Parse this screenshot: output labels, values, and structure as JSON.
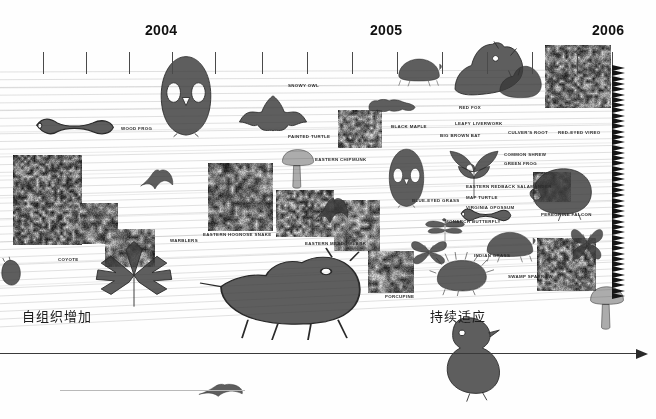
{
  "figure": {
    "type": "timeline-infographic",
    "background_color": "#fefefe",
    "line_color": "#dcdcdc",
    "axis_color": "#3a3a3a",
    "text_color": "#2a2a2a"
  },
  "timeline": {
    "years": [
      {
        "label": "2004",
        "x": 165
      },
      {
        "label": "2005",
        "x": 390
      },
      {
        "label": "2006",
        "x": 612
      }
    ],
    "tick_y": 52,
    "tick_height": 22,
    "tick_positions": [
      43,
      86,
      129,
      172,
      215,
      262,
      307,
      352,
      397,
      442,
      487,
      532,
      577,
      612
    ]
  },
  "annotations": [
    {
      "id": "left-note",
      "text": "自组织增加",
      "x": 22,
      "y": 306
    },
    {
      "id": "right-note",
      "text": "持续适应",
      "x": 430,
      "y": 306
    }
  ],
  "species_labels": [
    {
      "text": "WOOD FROG",
      "x": 121,
      "y": 126
    },
    {
      "text": "SNOWY OWL",
      "x": 288,
      "y": 83
    },
    {
      "text": "PAINTED TURTLE",
      "x": 288,
      "y": 134
    },
    {
      "text": "EASTERN CHIPMUNK",
      "x": 315,
      "y": 157
    },
    {
      "text": "BLACK MAPLE",
      "x": 391,
      "y": 124
    },
    {
      "text": "BIG BROWN BAT",
      "x": 440,
      "y": 133
    },
    {
      "text": "RED FOX",
      "x": 459,
      "y": 105
    },
    {
      "text": "LEAFY LIVERWORK",
      "x": 455,
      "y": 121
    },
    {
      "text": "CULVER'S ROOT",
      "x": 508,
      "y": 130
    },
    {
      "text": "RED-EYED VIREO",
      "x": 558,
      "y": 130
    },
    {
      "text": "COMMON SHREW",
      "x": 504,
      "y": 152
    },
    {
      "text": "GREEN FROG",
      "x": 504,
      "y": 161
    },
    {
      "text": "EASTERN REDBACK SALAMANDER",
      "x": 466,
      "y": 184
    },
    {
      "text": "MAP TURTLE",
      "x": 466,
      "y": 195
    },
    {
      "text": "BLUE-EYED GRASS",
      "x": 412,
      "y": 198
    },
    {
      "text": "VIRGINIA OPOSSUM",
      "x": 466,
      "y": 205
    },
    {
      "text": "PEREGRINE FALCON",
      "x": 541,
      "y": 212
    },
    {
      "text": "MONARCH BUTTERFLY",
      "x": 445,
      "y": 219
    },
    {
      "text": "INDIAN GRASS",
      "x": 474,
      "y": 253
    },
    {
      "text": "SWAMP SPARROW",
      "x": 508,
      "y": 274
    },
    {
      "text": "EASTERN HOGNOSE SNAKE",
      "x": 203,
      "y": 232
    },
    {
      "text": "EASTERN MEADOWLARK",
      "x": 305,
      "y": 241
    },
    {
      "text": "WARBLERS",
      "x": 170,
      "y": 238
    },
    {
      "text": "COYOTE",
      "x": 58,
      "y": 257
    },
    {
      "text": "PORCUPINE",
      "x": 385,
      "y": 294
    }
  ],
  "photo_tiles": [
    {
      "name": "sunflower-field-tile",
      "x": 13,
      "y": 155,
      "w": 69,
      "h": 90,
      "seed": 11,
      "scale": 3.2,
      "dark": 0.62
    },
    {
      "name": "wild-plants-tile",
      "x": 80,
      "y": 203,
      "w": 38,
      "h": 41,
      "seed": 23,
      "scale": 4.0,
      "dark": 0.48
    },
    {
      "name": "hognose-snake-tile",
      "x": 208,
      "y": 163,
      "w": 65,
      "h": 68,
      "seed": 31,
      "scale": 3.6,
      "dark": 0.5
    },
    {
      "name": "meadowlark-field-tile",
      "x": 276,
      "y": 190,
      "w": 58,
      "h": 47,
      "seed": 43,
      "scale": 3.0,
      "dark": 0.42
    },
    {
      "name": "black-maple-tile",
      "x": 338,
      "y": 110,
      "w": 44,
      "h": 38,
      "seed": 57,
      "scale": 3.4,
      "dark": 0.38
    },
    {
      "name": "red-eyed-vireo-tile",
      "x": 545,
      "y": 45,
      "w": 66,
      "h": 63,
      "seed": 67,
      "scale": 3.1,
      "dark": 0.46
    },
    {
      "name": "peregrine-nest-tile",
      "x": 533,
      "y": 172,
      "w": 38,
      "h": 30,
      "seed": 71,
      "scale": 4.4,
      "dark": 0.44
    },
    {
      "name": "swamp-sparrow-tile",
      "x": 537,
      "y": 238,
      "w": 59,
      "h": 53,
      "seed": 83,
      "scale": 3.3,
      "dark": 0.52
    },
    {
      "name": "blue-eyed-grass-tile",
      "x": 334,
      "y": 200,
      "w": 46,
      "h": 51,
      "seed": 97,
      "scale": 3.8,
      "dark": 0.34
    },
    {
      "name": "indian-grass-tile",
      "x": 105,
      "y": 229,
      "w": 50,
      "h": 38,
      "seed": 29,
      "scale": 3.5,
      "dark": 0.47
    },
    {
      "name": "porcupine-habitat-tile",
      "x": 368,
      "y": 251,
      "w": 46,
      "h": 42,
      "seed": 53,
      "scale": 3.7,
      "dark": 0.4
    }
  ],
  "specimens": [
    {
      "name": "wood-frog",
      "shape": "salamander",
      "x": 35,
      "y": 108,
      "w": 80,
      "h": 30
    },
    {
      "name": "snowy-owl",
      "shape": "owl",
      "x": 155,
      "y": 55,
      "w": 62,
      "h": 85
    },
    {
      "name": "big-brown-bat",
      "shape": "bat",
      "x": 238,
      "y": 93,
      "w": 70,
      "h": 42
    },
    {
      "name": "warbler-bird",
      "shape": "flyingbird",
      "x": 140,
      "y": 168,
      "w": 34,
      "h": 22
    },
    {
      "name": "eastern-chipmunk",
      "shape": "mushroom",
      "x": 280,
      "y": 148,
      "w": 36,
      "h": 40
    },
    {
      "name": "painted-turtle",
      "shape": "turtle",
      "x": 396,
      "y": 55,
      "w": 48,
      "h": 32
    },
    {
      "name": "red-fox",
      "shape": "fox",
      "x": 452,
      "y": 40,
      "w": 75,
      "h": 58
    },
    {
      "name": "culvers-root",
      "shape": "fox2",
      "x": 497,
      "y": 62,
      "w": 48,
      "h": 38
    },
    {
      "name": "leafy-liverwork",
      "shape": "caterpillar",
      "x": 368,
      "y": 99,
      "w": 48,
      "h": 14
    },
    {
      "name": "barred-owl",
      "shape": "owl",
      "x": 385,
      "y": 148,
      "w": 43,
      "h": 62
    },
    {
      "name": "common-shrew-plant",
      "shape": "plant",
      "x": 444,
      "y": 148,
      "w": 60,
      "h": 52
    },
    {
      "name": "virginia-opossum",
      "shape": "opossum",
      "x": 528,
      "y": 163,
      "w": 66,
      "h": 58
    },
    {
      "name": "blue-eyed-grass-bird",
      "shape": "flyingbird",
      "x": 315,
      "y": 196,
      "w": 34,
      "h": 28
    },
    {
      "name": "map-turtle-salamander",
      "shape": "salamander",
      "x": 460,
      "y": 200,
      "w": 52,
      "h": 24
    },
    {
      "name": "monarch-butterfly",
      "shape": "dragonfly",
      "x": 424,
      "y": 218,
      "w": 42,
      "h": 30
    },
    {
      "name": "butterfly-black",
      "shape": "butterfly",
      "x": 410,
      "y": 236,
      "w": 38,
      "h": 30
    },
    {
      "name": "swamp-turtle",
      "shape": "turtle",
      "x": 484,
      "y": 228,
      "w": 54,
      "h": 35
    },
    {
      "name": "swallowtail",
      "shape": "butterfly",
      "x": 570,
      "y": 222,
      "w": 34,
      "h": 40
    },
    {
      "name": "porcupine",
      "shape": "porcupine",
      "x": 434,
      "y": 252,
      "w": 60,
      "h": 44
    },
    {
      "name": "coyote",
      "shape": "coyote",
      "x": 218,
      "y": 248,
      "w": 150,
      "h": 92
    },
    {
      "name": "maple-leaves",
      "shape": "leaves",
      "x": 93,
      "y": 240,
      "w": 82,
      "h": 68
    },
    {
      "name": "mushroom-right",
      "shape": "mushroom",
      "x": 588,
      "y": 285,
      "w": 38,
      "h": 44
    },
    {
      "name": "peregrine-falcon",
      "shape": "falcon",
      "x": 434,
      "y": 315,
      "w": 70,
      "h": 88
    },
    {
      "name": "slug-left",
      "shape": "slug",
      "x": 0,
      "y": 258,
      "w": 22,
      "h": 30
    },
    {
      "name": "flying-bird-bottom",
      "shape": "flyingbird",
      "x": 198,
      "y": 383,
      "w": 46,
      "h": 14
    }
  ],
  "axes": {
    "main": {
      "x": 0,
      "y": 353,
      "width": 636,
      "arrow": true
    },
    "faint": {
      "x": 60,
      "y": 390,
      "width": 185
    }
  }
}
